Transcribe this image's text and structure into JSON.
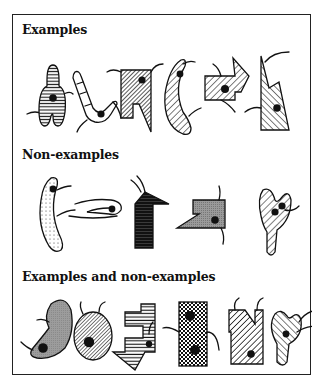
{
  "sections": [
    {
      "title": "Examples",
      "figures": [
        {
          "shape": "keyhole-blob",
          "pattern": "horizontal-stripes",
          "dots": 1,
          "tails": 2
        },
        {
          "shape": "bent-rod",
          "pattern": "white-with-bands",
          "dots": 1,
          "tails": 2
        },
        {
          "shape": "flag-rectangle",
          "pattern": "dense-diagonal-stripes",
          "dots": 1,
          "tails": 2
        },
        {
          "shape": "crescent",
          "pattern": "diagonal-stripes",
          "dots": 1,
          "tails": 2
        },
        {
          "shape": "arrow-block",
          "pattern": "diagonal-stripes",
          "dots": 1,
          "tails": 2
        },
        {
          "shape": "double-spike",
          "pattern": "diagonal-stripes",
          "dots": 1,
          "tails": 2
        }
      ]
    },
    {
      "title": "Non-examples",
      "figures": [
        {
          "shape": "crescent",
          "pattern": "dotted",
          "dots": 1,
          "tails": 2
        },
        {
          "shape": "hairpin-loop",
          "pattern": "none",
          "dots": 1,
          "tails": 0
        },
        {
          "shape": "arrow-block",
          "pattern": "black-horizontal-stripes",
          "dots": 0,
          "tails": 2
        },
        {
          "shape": "notched-block",
          "pattern": "gray-fine",
          "dots": 1,
          "tails": 2
        },
        {
          "shape": "y-blob",
          "pattern": "diagonal-stripes",
          "dots": 2,
          "tails": 1
        }
      ]
    },
    {
      "title": "Examples and non-examples",
      "figures": [
        {
          "shape": "kidney",
          "pattern": "gray",
          "dots": 1,
          "tails": 2
        },
        {
          "shape": "oval",
          "pattern": "dense-diagonal-stripes",
          "dots": 1,
          "tails": 2
        },
        {
          "shape": "down-arrow-block",
          "pattern": "horizontal-stripes",
          "dots": 1,
          "tails": 1
        },
        {
          "shape": "rectangle",
          "pattern": "checkered",
          "dots": 2,
          "tails": 2
        },
        {
          "shape": "n-block",
          "pattern": "diagonal-stripes",
          "dots": 1,
          "tails": 2
        },
        {
          "shape": "y-blob",
          "pattern": "diagonal-stripes",
          "dots": 1,
          "tails": 2
        }
      ]
    }
  ]
}
